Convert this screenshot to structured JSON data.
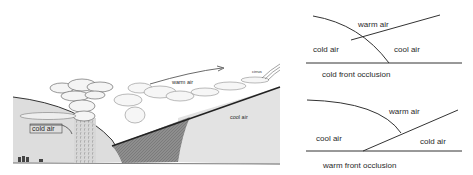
{
  "left_illustration": {
    "labels": {
      "cold_air": "cold air",
      "warm_air": "warm air",
      "cool_air": "cool air",
      "cirrus": "cirrus"
    }
  },
  "cold_front_occlusion": {
    "caption": "cold front occlusion",
    "labels": {
      "warm_air": "warm air",
      "cold_air": "cold air",
      "cool_air": "cool air"
    }
  },
  "warm_front_occlusion": {
    "caption": "warm front occlusion",
    "labels": {
      "warm_air": "warm air",
      "cool_air": "cool air",
      "cold_air": "cold air"
    }
  },
  "colors": {
    "line": "#333333",
    "cold_air_fill": "#dcdcdc",
    "cool_air_fill": "#e2e2e2",
    "frontal_zone_fill": "#8a8a8a",
    "text": "#2a2a2a"
  }
}
